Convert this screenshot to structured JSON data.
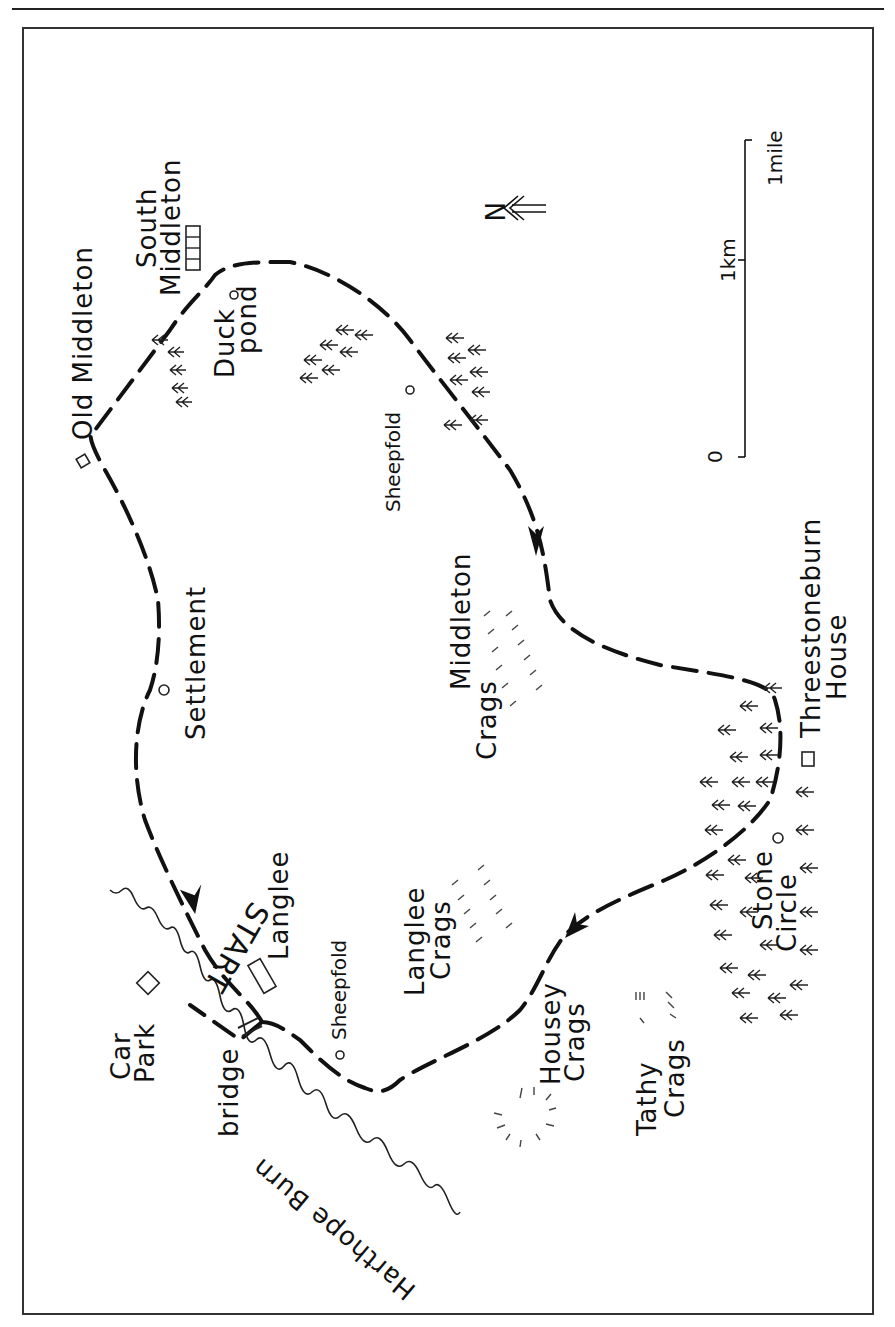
{
  "map": {
    "title": "",
    "orientation_note": "rotated 90deg; north arrow points left",
    "labels": {
      "old_middleton": "Old Middleton",
      "south_middleton_1": "South",
      "south_middleton_2": "Middleton",
      "duck_pond_1": "Duck",
      "duck_pond_2": "pond",
      "sheepfold_north": "Sheepfold",
      "settlement": "Settlement",
      "middleton_crags_1": "Middleton",
      "middleton_crags_2": "Crags",
      "threestoneburn_1": "Threestoneburn",
      "threestoneburn_2": "House",
      "stone_circle_1": "Stone",
      "stone_circle_2": "Circle",
      "langlee": "Langlee",
      "langlee_crags_1": "Langlee",
      "langlee_crags_2": "Crags",
      "sheepfold_south": "Sheepfold",
      "housey_crags_1": "Housey",
      "housey_crags_2": "Crags",
      "tathy_crags_1": "Tathy",
      "tathy_crags_2": "Crags",
      "start": "START",
      "car_park_1": "Car",
      "car_park_2": "Park",
      "bridge": "bridge",
      "harthope_burn": "Harthope Burn"
    },
    "north_arrow": {
      "label": "N",
      "icon": "north-arrow-icon"
    },
    "scale_bar": {
      "zero": "0",
      "km": "1km",
      "mile": "1mile"
    },
    "colors": {
      "ink": "#111111",
      "paper": "#ffffff",
      "frame": "#333333"
    }
  }
}
